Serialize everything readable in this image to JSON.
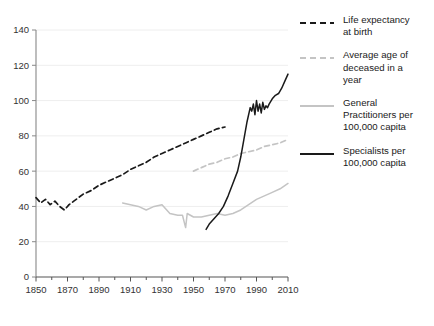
{
  "chart_data": {
    "type": "line",
    "title": "",
    "xlabel": "",
    "ylabel": "",
    "xlim": [
      1850,
      2010
    ],
    "ylim": [
      0,
      140
    ],
    "grid": true,
    "legend_position": "right",
    "yticks": [
      0,
      20,
      40,
      60,
      80,
      100,
      120,
      140
    ],
    "xticks": [
      1850,
      1870,
      1890,
      1910,
      1930,
      1950,
      1970,
      1990,
      2010
    ],
    "xminor_step": 10,
    "series": [
      {
        "name": "Life expectancy at birth",
        "legend_label": "Life expectancy\nat birth",
        "style": "dashed",
        "color": "#1a1a1a",
        "x": [
          1850,
          1853,
          1856,
          1859,
          1862,
          1865,
          1868,
          1871,
          1874,
          1877,
          1880,
          1885,
          1890,
          1895,
          1900,
          1905,
          1910,
          1915,
          1920,
          1925,
          1930,
          1935,
          1940,
          1945,
          1950,
          1955,
          1960,
          1965,
          1970
        ],
        "values": [
          45,
          42,
          44,
          41,
          43,
          40,
          38,
          41,
          43,
          45,
          47,
          49,
          52,
          54,
          56,
          58,
          61,
          63,
          65,
          68,
          70,
          72,
          74,
          76,
          78,
          80,
          82,
          84,
          85
        ]
      },
      {
        "name": "Average age of deceased in a year",
        "legend_label": "Average age of\ndeceased in a\nyear",
        "style": "dashed",
        "color": "#c4c4c4",
        "x": [
          1950,
          1955,
          1960,
          1965,
          1970,
          1975,
          1980,
          1985,
          1990,
          1995,
          2000,
          2005,
          2010
        ],
        "values": [
          60,
          62,
          64,
          65,
          67,
          68,
          70,
          71,
          72,
          74,
          75,
          76,
          78
        ]
      },
      {
        "name": "General Practitioners per 100,000 capita",
        "legend_label": "General\nPractitioners per\n100,000 capita",
        "style": "solid",
        "color": "#c4c4c4",
        "x": [
          1905,
          1910,
          1915,
          1920,
          1925,
          1930,
          1935,
          1940,
          1943,
          1945,
          1946,
          1948,
          1950,
          1955,
          1960,
          1965,
          1970,
          1975,
          1980,
          1985,
          1990,
          1995,
          2000,
          2005,
          2010
        ],
        "values": [
          42,
          41,
          40,
          38,
          40,
          41,
          36,
          35,
          35,
          28,
          36,
          35,
          34,
          34,
          35,
          36,
          35,
          36,
          38,
          41,
          44,
          46,
          48,
          50,
          53
        ]
      },
      {
        "name": "Specialists per 100,000 capita",
        "legend_label": "Specialists per\n100,000 capita",
        "style": "solid",
        "color": "#1a1a1a",
        "x": [
          1958,
          1960,
          1963,
          1966,
          1969,
          1972,
          1975,
          1978,
          1980,
          1982,
          1984,
          1986,
          1987,
          1988,
          1989,
          1990,
          1991,
          1992,
          1993,
          1994,
          1995,
          1996,
          1997,
          1998,
          2000,
          2002,
          2004,
          2006,
          2008,
          2010
        ],
        "values": [
          27,
          30,
          33,
          36,
          40,
          46,
          53,
          60,
          68,
          78,
          88,
          96,
          94,
          98,
          92,
          100,
          94,
          98,
          93,
          99,
          95,
          97,
          96,
          98,
          101,
          103,
          104,
          107,
          111,
          115
        ]
      }
    ]
  }
}
